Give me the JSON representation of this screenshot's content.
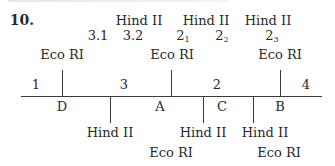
{
  "question_number": "10.",
  "map": {
    "top_enzyme_labels": [
      {
        "id": "hind-3-group",
        "label": "Hind II",
        "x": 139
      },
      {
        "id": "hind-2-group-a",
        "label": "Hind II",
        "x": 206
      },
      {
        "id": "hind-2-group-b",
        "label": "Hind II",
        "x": 268
      }
    ],
    "fragment_labels_top": [
      {
        "text": "3.1",
        "sub": "",
        "x": 98
      },
      {
        "text": "3.2",
        "sub": "",
        "x": 133
      },
      {
        "text": "2",
        "sub": "1",
        "x": 183
      },
      {
        "text": "2",
        "sub": "2",
        "x": 222
      },
      {
        "text": "2",
        "sub": "3",
        "x": 272
      }
    ],
    "upper_eco_labels": [
      {
        "label": "Eco RI",
        "x": 62
      },
      {
        "label": "Eco RI",
        "x": 172
      },
      {
        "label": "Eco RI",
        "x": 280
      }
    ],
    "segment_numbers": [
      {
        "text": "1",
        "x": 36
      },
      {
        "text": "3",
        "x": 124
      },
      {
        "text": "2",
        "x": 217
      },
      {
        "text": "4",
        "x": 306
      }
    ],
    "fragment_letters": [
      {
        "text": "D",
        "x": 62
      },
      {
        "text": "A",
        "x": 160
      },
      {
        "text": "C",
        "x": 222
      },
      {
        "text": "B",
        "x": 280
      }
    ],
    "lower_hind_labels": [
      {
        "label": "Hind II",
        "x": 110
      },
      {
        "label": "Hind II",
        "x": 203
      },
      {
        "label": "Hind II",
        "x": 265
      }
    ],
    "lower_eco_labels": [
      {
        "label": "Eco RI",
        "x": 171
      },
      {
        "label": "Eco RI",
        "x": 279
      }
    ],
    "eco_cut_positions": [
      62,
      171,
      280
    ],
    "hind_cut_positions": [
      110,
      203,
      253
    ]
  }
}
